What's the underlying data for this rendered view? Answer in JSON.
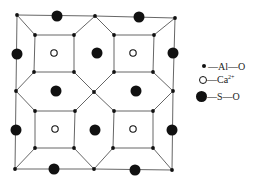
{
  "diagram": {
    "line_color": "#555555",
    "atom_color": "#111111",
    "al_nodes": [
      [
        17,
        15
      ],
      [
        95,
        16
      ],
      [
        175,
        18
      ],
      [
        35,
        35
      ],
      [
        74,
        35
      ],
      [
        114,
        35
      ],
      [
        154,
        35
      ],
      [
        34,
        72
      ],
      [
        74,
        72
      ],
      [
        114,
        72
      ],
      [
        153,
        72
      ],
      [
        16,
        91
      ],
      [
        94,
        92
      ],
      [
        173,
        91
      ],
      [
        35,
        111
      ],
      [
        75,
        111
      ],
      [
        114,
        111
      ],
      [
        153,
        111
      ],
      [
        35,
        148
      ],
      [
        74,
        148
      ],
      [
        113,
        148
      ],
      [
        153,
        148
      ],
      [
        15,
        169
      ],
      [
        94,
        169
      ],
      [
        172,
        170
      ]
    ],
    "ca_sites": [
      [
        54,
        53
      ],
      [
        133,
        53
      ],
      [
        55,
        129
      ],
      [
        133,
        129
      ]
    ],
    "s_sites": [
      [
        57,
        16
      ],
      [
        139,
        17
      ],
      [
        17,
        54
      ],
      [
        97,
        53
      ],
      [
        173,
        53
      ],
      [
        56,
        91
      ],
      [
        136,
        91
      ],
      [
        16,
        130
      ],
      [
        95,
        130
      ],
      [
        172,
        130
      ],
      [
        54,
        169
      ],
      [
        135,
        170
      ]
    ],
    "edges": [
      [
        0,
        1
      ],
      [
        1,
        2
      ],
      [
        0,
        11
      ],
      [
        2,
        13
      ],
      [
        11,
        22
      ],
      [
        13,
        24
      ],
      [
        22,
        23
      ],
      [
        23,
        24
      ],
      [
        3,
        4
      ],
      [
        4,
        8
      ],
      [
        8,
        7
      ],
      [
        7,
        3
      ],
      [
        5,
        6
      ],
      [
        6,
        10
      ],
      [
        10,
        9
      ],
      [
        9,
        5
      ],
      [
        14,
        15
      ],
      [
        15,
        19
      ],
      [
        19,
        18
      ],
      [
        18,
        14
      ],
      [
        16,
        17
      ],
      [
        17,
        21
      ],
      [
        21,
        20
      ],
      [
        20,
        16
      ],
      [
        0,
        3
      ],
      [
        1,
        4
      ],
      [
        1,
        5
      ],
      [
        2,
        6
      ],
      [
        7,
        11
      ],
      [
        8,
        12
      ],
      [
        9,
        12
      ],
      [
        10,
        13
      ],
      [
        11,
        14
      ],
      [
        12,
        15
      ],
      [
        12,
        16
      ],
      [
        13,
        17
      ],
      [
        18,
        22
      ],
      [
        19,
        23
      ],
      [
        20,
        23
      ],
      [
        21,
        24
      ]
    ]
  },
  "legend": {
    "al_label": "—Al—O",
    "ca_label": "—Ca",
    "ca_charge": "2+",
    "s_label": "—S—O"
  }
}
